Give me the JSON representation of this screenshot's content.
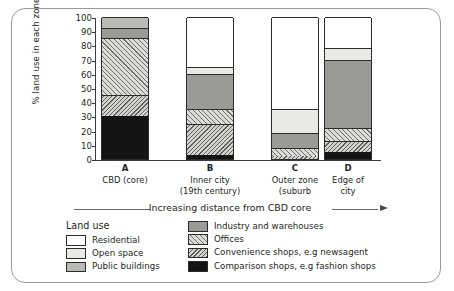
{
  "chart_data": {
    "type": "bar",
    "subtype": "stacked-bar-100",
    "title": "",
    "xlabel": "Increasing distance from CBD core",
    "ylabel": "% land use in each zone",
    "ylim": [
      0,
      100
    ],
    "yticks": [
      0,
      10,
      20,
      30,
      40,
      50,
      60,
      70,
      80,
      90,
      100
    ],
    "grid": false,
    "legend_position": "bottom",
    "legend_title": "Land use",
    "categories": [
      "A",
      "B",
      "C",
      "D"
    ],
    "category_captions": [
      [
        "CBD (core)"
      ],
      [
        "Inner city",
        "(19th century)"
      ],
      [
        "Outer zone",
        "(suburb"
      ],
      [
        "Edge of",
        "city"
      ]
    ],
    "series": [
      {
        "name": "Residential",
        "key": "residential",
        "values": [
          0,
          35,
          65,
          22
        ]
      },
      {
        "name": "Open space",
        "key": "open",
        "values": [
          0,
          5,
          17,
          8
        ]
      },
      {
        "name": "Public buildings",
        "key": "public",
        "values": [
          8,
          0,
          0,
          0
        ]
      },
      {
        "name": "Industry and warehouses",
        "key": "industry",
        "values": [
          7,
          25,
          10,
          48
        ]
      },
      {
        "name": "Offices",
        "key": "offices",
        "values": [
          40,
          10,
          6,
          9
        ]
      },
      {
        "name": "Convenience shops, e.g newsagent",
        "key": "convenience",
        "values": [
          15,
          22,
          2,
          8
        ]
      },
      {
        "name": "Comparison shops, e.g fashion shops",
        "key": "comparison",
        "values": [
          30,
          3,
          0,
          5
        ]
      }
    ],
    "stack_order_bottom_to_top": [
      "comparison",
      "convenience",
      "offices",
      "industry",
      "public",
      "open",
      "residential"
    ],
    "colors": {
      "residential": "#ffffff",
      "open": "#e9e9e7",
      "public": "#b9b9b7",
      "industry": "#9a9a98",
      "offices": "#dcdcda",
      "convenience": "#d2d2d0",
      "comparison": "#141414",
      "axis": "#3a3a3a",
      "frame": "#9a9a9a"
    }
  },
  "legend": {
    "title": "Land use",
    "column_a": [
      "Residential",
      "Open space",
      "Public buildings"
    ],
    "column_b": [
      "Industry and warehouses",
      "Offices",
      "Convenience shops, e.g newsagent",
      "Comparison shops, e.g fashion shops"
    ]
  },
  "axis": {
    "y_title": "% land use in each zone",
    "x_caption": "Increasing distance from CBD core"
  }
}
